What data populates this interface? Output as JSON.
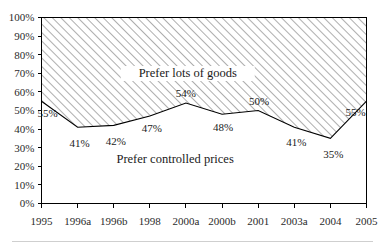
{
  "chart_data": {
    "type": "area",
    "title": "",
    "subtitle": "",
    "xlabel": "",
    "ylabel": "",
    "ylim": [
      0,
      100
    ],
    "ytick_step": 10,
    "grid": false,
    "legend_position": "inline-annotations",
    "categories": [
      "1995",
      "1996a",
      "1996b",
      "1998",
      "2000a",
      "2000b",
      "2001",
      "2003a",
      "2004",
      "2005"
    ],
    "series": [
      {
        "name": "Prefer controlled prices",
        "values": [
          55,
          41,
          42,
          47,
          54,
          48,
          50,
          41,
          35,
          55
        ],
        "value_labels": [
          "55%",
          "41%",
          "42%",
          "47%",
          "54%",
          "48%",
          "50%",
          "41%",
          "35%",
          "55%"
        ]
      },
      {
        "name": "Prefer lots of goods",
        "values": [
          45,
          59,
          58,
          53,
          46,
          52,
          50,
          59,
          65,
          45
        ]
      }
    ],
    "annotations": [
      {
        "text": "Prefer lots of goods",
        "x_index": 4.05,
        "y_value": 68,
        "boxed": true
      },
      {
        "text": "Prefer controlled prices",
        "x_index": 3.7,
        "y_value": 22,
        "boxed": false
      }
    ],
    "ytick_labels": [
      "0%",
      "10%",
      "20%",
      "30%",
      "40%",
      "50%",
      "60%",
      "70%",
      "80%",
      "90%",
      "100%"
    ],
    "colors": {
      "line": "#000000",
      "upper_area_fill": "#ffffff",
      "upper_area_hatch": "#9a9a9a",
      "lower_area_fill": "#ffffff",
      "frame": "#000000",
      "text": "#1a1a1a"
    },
    "label_offsets": [
      {
        "index": 0,
        "dx": 6,
        "dy": 16
      },
      {
        "index": 1,
        "dx": 2,
        "dy": 20
      },
      {
        "index": 2,
        "dx": 2,
        "dy": 20
      },
      {
        "index": 3,
        "dx": 2,
        "dy": 16
      },
      {
        "index": 4,
        "dx": 0,
        "dy": -6
      },
      {
        "index": 5,
        "dx": 1,
        "dy": 17
      },
      {
        "index": 6,
        "dx": 1,
        "dy": -6
      },
      {
        "index": 7,
        "dx": 2,
        "dy": 19
      },
      {
        "index": 8,
        "dx": 3,
        "dy": 20
      },
      {
        "index": 9,
        "dx": -11,
        "dy": 15
      }
    ]
  }
}
